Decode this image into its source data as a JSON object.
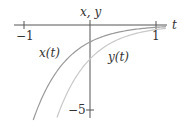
{
  "chart_data": {
    "type": "line",
    "title": "",
    "xlabel": "t",
    "ylabel": "x, y",
    "xlim": [
      -1,
      1.15
    ],
    "ylim": [
      -5.5,
      0.3
    ],
    "x_ticks": [
      {
        "value": -1,
        "label": "−1"
      },
      {
        "value": 1,
        "label": "1"
      }
    ],
    "y_ticks": [
      {
        "value": -5,
        "label": "−5"
      }
    ],
    "grid": false,
    "legend": "inline curve labels",
    "series": [
      {
        "name": "x(t)",
        "label": "x(t)",
        "formula": "-e^(-2t)",
        "color": "#9a9a9a",
        "t_start": -0.86,
        "t_end": 1.15,
        "points": [
          [
            -0.86,
            -5.58
          ],
          [
            -0.5,
            -2.72
          ],
          [
            0,
            -1.0
          ],
          [
            0.5,
            -0.37
          ],
          [
            1,
            -0.14
          ]
        ]
      },
      {
        "name": "y(t)",
        "label": "y(t)",
        "formula": "-2e^(-2t)",
        "color": "#c8c8c8",
        "t_start": -0.5,
        "t_end": 1.15,
        "points": [
          [
            -0.5,
            -5.44
          ],
          [
            0,
            -2.0
          ],
          [
            0.5,
            -0.74
          ],
          [
            1,
            -0.27
          ]
        ]
      }
    ],
    "axis_color": "#555555"
  }
}
